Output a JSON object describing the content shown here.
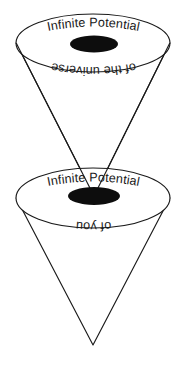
{
  "diagram": {
    "background_color": "#ffffff",
    "line_color": "#1a1a1a",
    "singularity_color": "#0d0d0d",
    "cones": [
      {
        "id": "upper-cone",
        "label_top": "Infinite Potential",
        "label_bottom": "of the universe",
        "label_bottom_orientation": "rotated-180",
        "rim": {
          "cx": 93,
          "cy": 43,
          "rx": 77,
          "ry": 29
        },
        "singularity": {
          "cx": 94,
          "cy": 44,
          "rx": 24,
          "ry": 8.5
        },
        "apex": {
          "x": 94,
          "y": 196
        }
      },
      {
        "id": "lower-cone",
        "label_top": "Infinite Potential",
        "label_bottom": "of you",
        "label_bottom_orientation": "rotated-180",
        "rim": {
          "cx": 93,
          "cy": 198,
          "rx": 77,
          "ry": 30
        },
        "singularity": {
          "cx": 94,
          "cy": 196,
          "rx": 26,
          "ry": 9
        },
        "apex": {
          "x": 93,
          "y": 345
        }
      }
    ]
  }
}
